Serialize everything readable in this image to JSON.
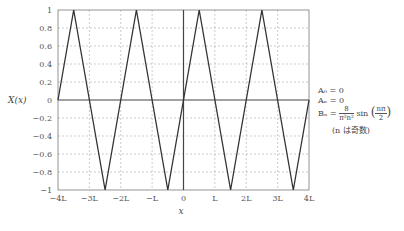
{
  "chart_data": {
    "type": "line",
    "title": "",
    "xlabel": "x",
    "ylabel": "X(x)",
    "x_units": "L",
    "xlim": [
      -4,
      4
    ],
    "ylim": [
      -1,
      1
    ],
    "grid": true,
    "grid_style": "dashed",
    "x_ticks": [
      -4,
      -3,
      -2,
      -1,
      0,
      1,
      2,
      3,
      4
    ],
    "x_tick_labels": [
      "−4L",
      "−3L",
      "−2L",
      "−L",
      "0",
      "L",
      "2L",
      "3L",
      "4L"
    ],
    "y_ticks": [
      1,
      0.8,
      0.6,
      0.4,
      0.2,
      0,
      -0.2,
      -0.4,
      -0.6,
      -0.8,
      -1
    ],
    "y_tick_labels": [
      "1",
      "0.8",
      "0.6",
      "0.4",
      "0.2",
      "0",
      "−0.2",
      "−0.4",
      "−0.6",
      "−0.8",
      "−1"
    ],
    "series": [
      {
        "name": "X(x) triangle wave",
        "color": "#333333",
        "x": [
          -4,
          -3.5,
          -2.5,
          -1.5,
          -0.5,
          0.5,
          1.5,
          2.5,
          3.5,
          4
        ],
        "y": [
          0,
          1,
          -1,
          1,
          -1,
          1,
          -1,
          1,
          -1,
          0
        ]
      }
    ],
    "annotations": {
      "A0": "A₀ = 0",
      "An": "Aₙ = 0",
      "Bn_prefix": "Bₙ =",
      "Bn_num": "8",
      "Bn_den": "π²n²",
      "Bn_sin": "sin",
      "Bn_arg_num": "nπ",
      "Bn_arg_den": "2",
      "note": "(n は奇数)"
    }
  }
}
